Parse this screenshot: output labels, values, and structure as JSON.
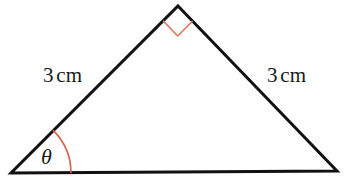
{
  "figure": {
    "kind": "geometry-diagram",
    "shape": "triangle",
    "background_color": "#fefefe",
    "stroke_color": "#111111",
    "stroke_width": 3,
    "marker_color": "#e0785f",
    "arc_color": "#d4604a"
  },
  "triangle": {
    "vertices": {
      "apex": {
        "x": 178,
        "y": 6
      },
      "left": {
        "x": 11,
        "y": 173
      },
      "right": {
        "x": 337,
        "y": 171
      }
    }
  },
  "labels": {
    "left_side": {
      "value": "3",
      "unit": "cm"
    },
    "right_side": {
      "value": "3",
      "unit": "cm"
    },
    "angle": "θ"
  },
  "markers": {
    "right_angle": {
      "at": "apex",
      "type": "square",
      "color": "#e0785f",
      "stroke_width": 1.6
    },
    "angle_arc": {
      "at": "left",
      "type": "arc",
      "color": "#d4604a",
      "stroke_width": 1.6
    }
  }
}
